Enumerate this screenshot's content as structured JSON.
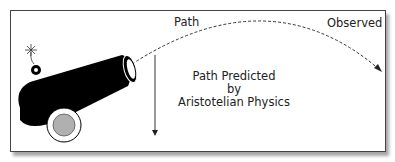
{
  "diagram": {
    "labels": {
      "path": "Path",
      "observed": "Observed",
      "predicted_line1": "Path Predicted",
      "predicted_line2": "by",
      "predicted_line3": "Aristotelian Physics"
    },
    "elements": [
      "cannon",
      "fuse-spark",
      "cannon-wheel",
      "observed-path-dashed-arc",
      "aristotelian-path-vertical-arrow"
    ],
    "colors": {
      "cannon": "#000000",
      "wheel_hub": "#b0b0b0",
      "frame": "#444444",
      "text": "#222222"
    }
  }
}
